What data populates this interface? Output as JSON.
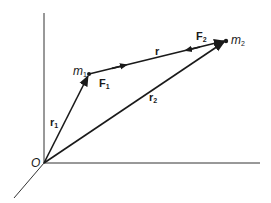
{
  "diagram": {
    "title": "",
    "origin_label": "O",
    "mass1": {
      "symbol": "m",
      "subscript": "1"
    },
    "mass2": {
      "symbol": "m",
      "subscript": "2"
    },
    "vectors": {
      "r1": {
        "symbol": "r",
        "subscript": "1"
      },
      "r2": {
        "symbol": "r",
        "subscript": "2"
      },
      "r": {
        "symbol": "r",
        "subscript": ""
      },
      "F1": {
        "symbol": "F",
        "subscript": "1"
      },
      "F2": {
        "symbol": "F",
        "subscript": "2"
      }
    },
    "colors": {
      "line": "#1a1a1a",
      "axis": "#333333",
      "background": "#ffffff"
    }
  }
}
